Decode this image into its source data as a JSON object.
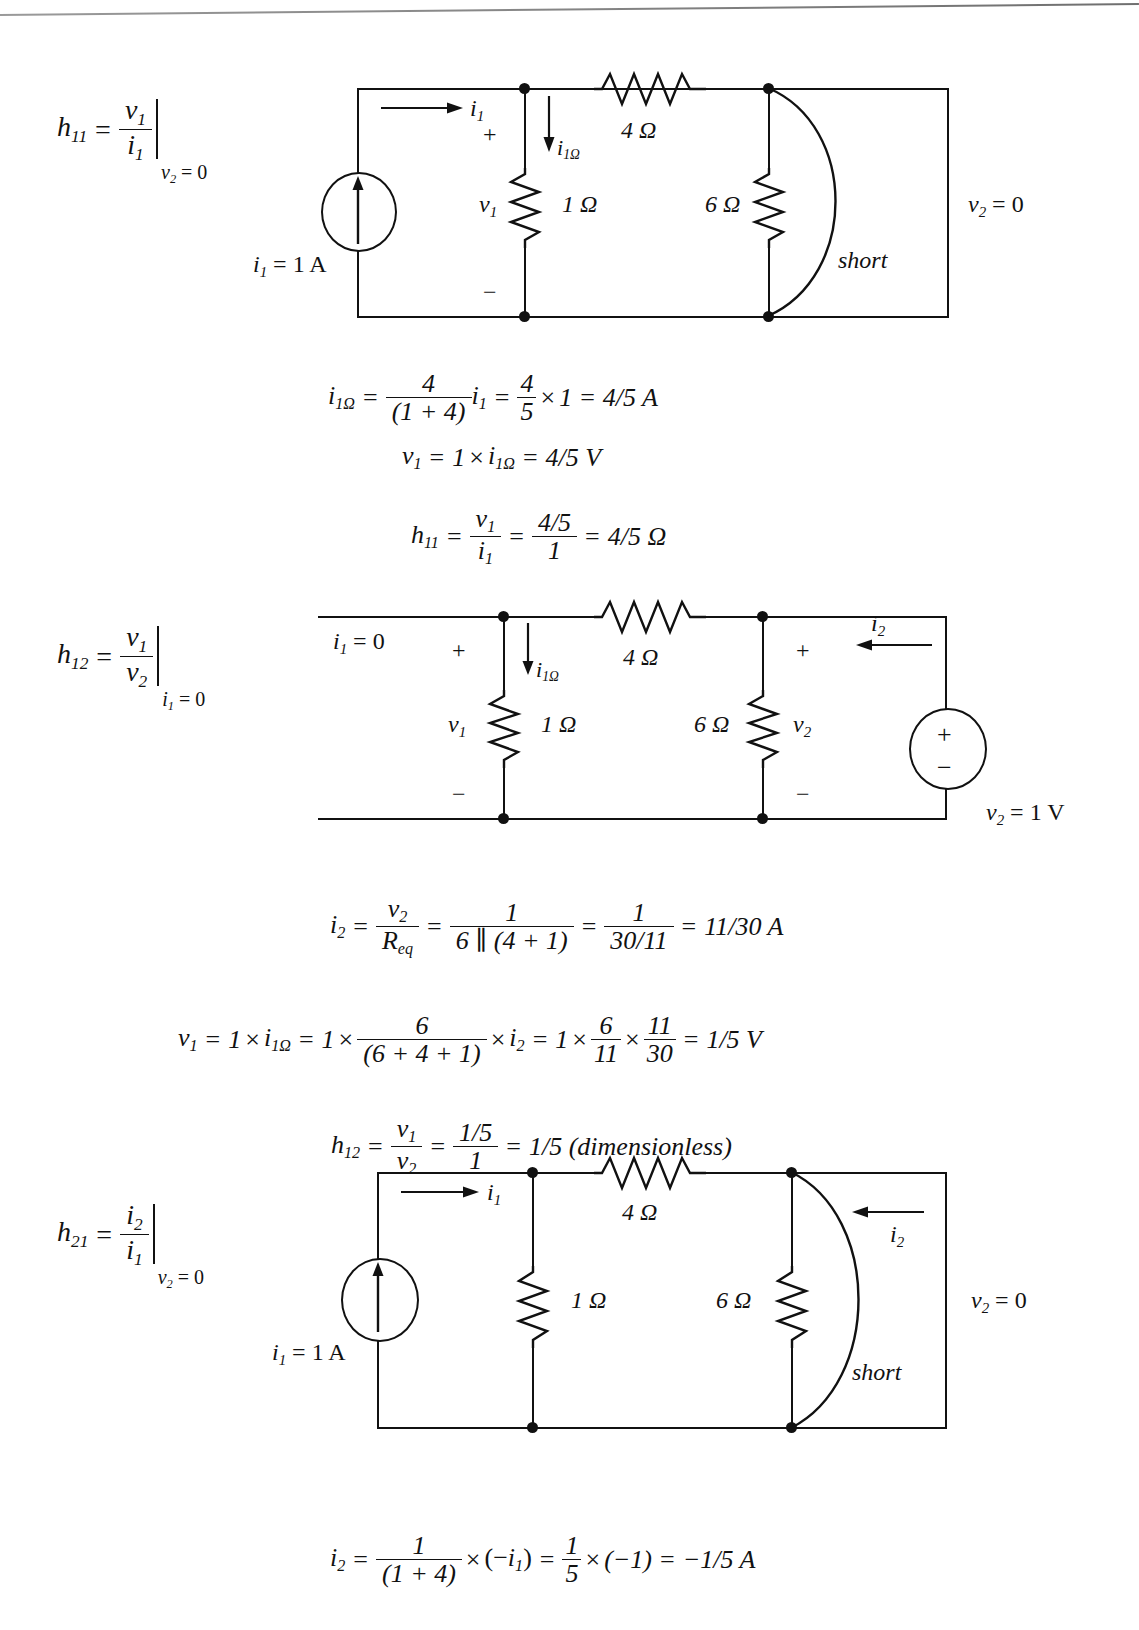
{
  "page": {
    "scan_artifact": "top-edge-scan-line"
  },
  "sections": [
    {
      "id": "h11",
      "definition": {
        "name": "h11",
        "symbol": "h",
        "subscript": "11",
        "numerator": "v",
        "numerator_sub": "1",
        "denominator": "i",
        "denominator_sub": "1",
        "condition": "v2 = 0",
        "condition_sym": "v",
        "condition_sub": "2",
        "condition_val": "= 0"
      },
      "circuit": {
        "source_label": "i1 = 1 A",
        "source_sym": "i",
        "source_sub": "1",
        "source_val": "= 1 A",
        "source_type": "current-source-up",
        "current_in": "i1",
        "current_in_sym": "i",
        "current_in_sub": "1",
        "branch_current": "i1Ω",
        "branch_current_sym": "i",
        "branch_current_sub": "1Ω",
        "v1_label": "v1",
        "v1_sym": "v",
        "v1_sub": "1",
        "plus": "+",
        "minus": "−",
        "r_series": "4 Ω",
        "r_shunt1": "1 Ω",
        "r_shunt2": "6 Ω",
        "short_label": "short",
        "output_label": "v2 = 0",
        "output_sym": "v",
        "output_sub": "2",
        "output_val": "= 0"
      },
      "equations": [
        {
          "id": "i1ohm-h11",
          "text": "i1Ω = 4/(1+4) i1 = 4/5 × 1 = 4/5 A",
          "lhs_sym": "i",
          "lhs_sub": "1Ω",
          "f1_num": "4",
          "f1_den": "(1 + 4)",
          "mult_sym": "i",
          "mult_sub": "1",
          "f2_num": "4",
          "f2_den": "5",
          "times_val": "1",
          "result": "4/5 A"
        },
        {
          "id": "v1-h11",
          "text": "v1 = 1 × i1Ω = 4/5 V",
          "lhs_sym": "v",
          "lhs_sub": "1",
          "one": "1",
          "mult_sym": "i",
          "mult_sub": "1Ω",
          "result": "4/5 V"
        },
        {
          "id": "h11-result",
          "text": "h11 = v1/i1 = (4/5)/1 = 4/5 Ω",
          "lhs_sym": "h",
          "lhs_sub": "11",
          "f1_num_sym": "v",
          "f1_num_sub": "1",
          "f1_den_sym": "i",
          "f1_den_sub": "1",
          "f2_num": "4/5",
          "f2_den": "1",
          "result": "4/5 Ω"
        }
      ]
    },
    {
      "id": "h12",
      "definition": {
        "name": "h12",
        "symbol": "h",
        "subscript": "12",
        "numerator": "v",
        "numerator_sub": "1",
        "denominator": "v",
        "denominator_sub": "2",
        "condition": "i1 = 0",
        "condition_sym": "i",
        "condition_sub": "1",
        "condition_val": "= 0"
      },
      "circuit": {
        "input_label": "i1 = 0",
        "input_sym": "i",
        "input_sub": "1",
        "input_val": "= 0",
        "branch_current": "i1Ω",
        "branch_current_sym": "i",
        "branch_current_sub": "1Ω",
        "v1_label": "v1",
        "v1_sym": "v",
        "v1_sub": "1",
        "v2_label": "v2",
        "v2_sym": "v",
        "v2_sub": "2",
        "plus": "+",
        "minus": "−",
        "r_series": "4 Ω",
        "r_shunt1": "1 Ω",
        "r_shunt2": "6 Ω",
        "current_out": "i2",
        "current_out_sym": "i",
        "current_out_sub": "2",
        "source_type": "voltage-source",
        "source_plus": "+",
        "source_minus": "−",
        "source_label": "v2 = 1 V",
        "source_sym": "v",
        "source_sub": "2",
        "source_val": "= 1 V"
      },
      "equations": [
        {
          "id": "i2-h12",
          "text": "i2 = v2/Req = 1/(6 ∥ (4+1)) = 1/(30/11) = 11/30 A",
          "lhs_sym": "i",
          "lhs_sub": "2",
          "f1_num_sym": "v",
          "f1_num_sub": "2",
          "f1_den_sym": "R",
          "f1_den_sub": "eq",
          "f2_num": "1",
          "f2_den": "6 ∥ (4 + 1)",
          "f3_num": "1",
          "f3_den": "30/11",
          "result": "11/30 A"
        },
        {
          "id": "v1-h12",
          "text": "v1 = 1 × i1Ω = 1 × 6/(6+4+1) × i2 = 1 × 6/11 × 11/30 = 1/5 V",
          "lhs_sym": "v",
          "lhs_sub": "1",
          "one": "1",
          "mult_sym": "i",
          "mult_sub": "1Ω",
          "one2": "1",
          "f1_num": "6",
          "f1_den": "(6 + 4 + 1)",
          "times_sym": "i",
          "times_sub": "2",
          "one3": "1",
          "f2_num": "6",
          "f2_den": "11",
          "f3_num": "11",
          "f3_den": "30",
          "result": "1/5 V"
        },
        {
          "id": "h12-result",
          "text": "h12 = v1/v2 = (1/5)/1 = 1/5 (dimensionless)",
          "lhs_sym": "h",
          "lhs_sub": "12",
          "f1_num_sym": "v",
          "f1_num_sub": "1",
          "f1_den_sym": "v",
          "f1_den_sub": "2",
          "f2_num": "1/5",
          "f2_den": "1",
          "result": "1/5 (dimensionless)"
        }
      ]
    },
    {
      "id": "h21",
      "definition": {
        "name": "h21",
        "symbol": "h",
        "subscript": "21",
        "numerator": "i",
        "numerator_sub": "2",
        "denominator": "i",
        "denominator_sub": "1",
        "condition": "v2 = 0",
        "condition_sym": "v",
        "condition_sub": "2",
        "condition_val": "= 0"
      },
      "circuit": {
        "source_label": "i1 = 1 A",
        "source_sym": "i",
        "source_sub": "1",
        "source_val": "= 1 A",
        "source_type": "current-source-up",
        "current_in": "i1",
        "current_in_sym": "i",
        "current_in_sub": "1",
        "r_series": "4 Ω",
        "r_shunt1": "1 Ω",
        "r_shunt2": "6 Ω",
        "current_out": "i2",
        "current_out_sym": "i",
        "current_out_sub": "2",
        "short_label": "short",
        "output_label": "v2 = 0",
        "output_sym": "v",
        "output_sub": "2",
        "output_val": "= 0"
      },
      "equations": [
        {
          "id": "i2-h21",
          "text": "i2 = 1/(1+4) × (−i1) = 1/5 × (−1) = −1/5 A",
          "lhs_sym": "i",
          "lhs_sub": "2",
          "f1_num": "1",
          "f1_den": "(1 + 4)",
          "mult_open": "(−",
          "mult_sym": "i",
          "mult_sub": "1",
          "mult_close": ")",
          "f2_num": "1",
          "f2_den": "5",
          "times_val": "(−1)",
          "result": "−1/5 A"
        }
      ]
    }
  ],
  "glyphs": {
    "equals": "=",
    "times": "×",
    "ohm": "Ω",
    "plus": "+",
    "minus": "−",
    "parallel": "∥"
  }
}
